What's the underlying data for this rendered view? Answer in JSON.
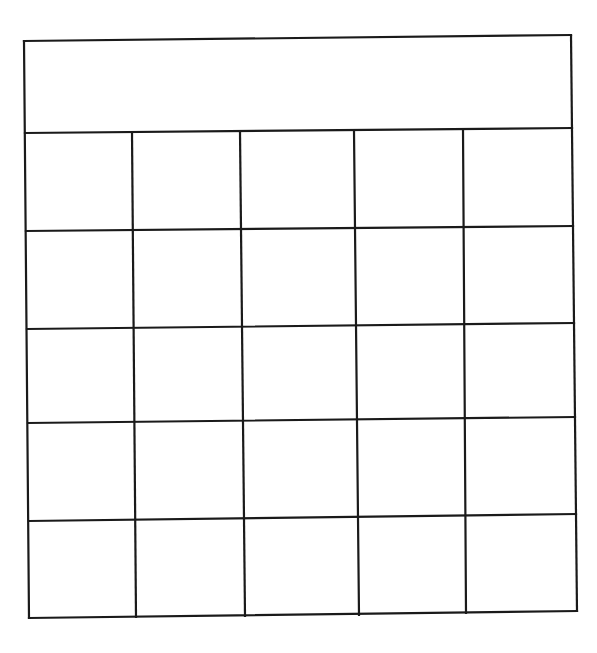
{
  "figure": {
    "line_color": "#1a1a1a",
    "background": "#ffffff",
    "header": {
      "text": "",
      "merged_columns": 5
    },
    "grid": {
      "rows": 5,
      "columns": 5,
      "cells": [
        [
          "",
          "",
          "",
          "",
          ""
        ],
        [
          "",
          "",
          "",
          "",
          ""
        ],
        [
          "",
          "",
          "",
          "",
          ""
        ],
        [
          "",
          "",
          "",
          "",
          ""
        ],
        [
          "",
          "",
          "",
          "",
          ""
        ]
      ]
    },
    "geometry": {
      "outer_top": {
        "left": [
          24,
          41
        ],
        "right": [
          571,
          35
        ]
      },
      "header_bottom": {
        "left": [
          25,
          133
        ],
        "right": [
          572,
          128
        ]
      },
      "row_lines": [
        {
          "left": [
            26,
            231
          ],
          "right": [
            573,
            226
          ]
        },
        {
          "left": [
            27,
            329
          ],
          "right": [
            574,
            323
          ]
        },
        {
          "left": [
            28,
            423
          ],
          "right": [
            575,
            417
          ]
        },
        {
          "left": [
            29,
            521
          ],
          "right": [
            576,
            514
          ]
        }
      ],
      "outer_bottom": {
        "left": [
          29,
          618
        ],
        "right": [
          577,
          611
        ]
      },
      "column_lines": [
        {
          "top": [
            24,
            41
          ],
          "bottom": [
            29,
            618
          ]
        },
        {
          "top": [
            132,
            133
          ],
          "bottom": [
            136,
            617
          ]
        },
        {
          "top": [
            240,
            132
          ],
          "bottom": [
            245,
            616
          ]
        },
        {
          "top": [
            354,
            131
          ],
          "bottom": [
            359,
            615
          ]
        },
        {
          "top": [
            463,
            129
          ],
          "bottom": [
            466,
            613
          ]
        },
        {
          "top": [
            571,
            35
          ],
          "bottom": [
            577,
            611
          ]
        }
      ]
    }
  }
}
